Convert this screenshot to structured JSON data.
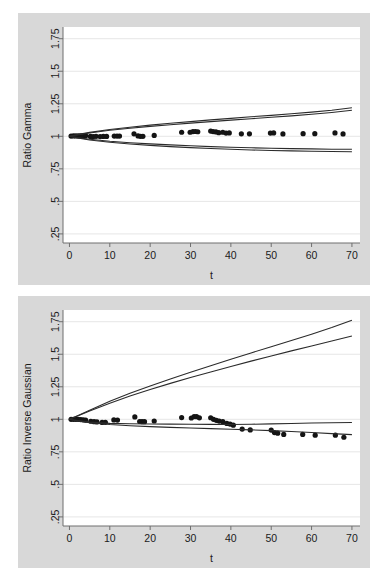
{
  "figure": {
    "background_color": "#ffffff",
    "panel_color": "#d8d8d8",
    "plot_color": "#ffffff",
    "grid_color": "#e6e6e6",
    "line_color": "#2b2b2b",
    "marker_color": "#141414"
  },
  "chart_data": [
    {
      "id": "gamma",
      "type": "scatter",
      "title": "",
      "xlabel": "t",
      "ylabel": "Ratio Gamma",
      "xlim": [
        -1.6,
        72
      ],
      "ylim": [
        0.18,
        1.84
      ],
      "xticks": [
        0,
        10,
        20,
        30,
        40,
        50,
        60,
        70
      ],
      "xticklabels": [
        "0",
        "10",
        "20",
        "30",
        "40",
        "50",
        "60",
        "70"
      ],
      "yticks": [
        0.25,
        0.5,
        0.75,
        1,
        1.25,
        1.5,
        1.75
      ],
      "yticklabels": [
        ".25",
        ".5",
        ".75",
        "1",
        "1.25",
        "1.5",
        "1.75"
      ],
      "grid": "horizontal",
      "legend": "none",
      "series": [
        {
          "name": "observed ratio",
          "kind": "points",
          "x": [
            0.4,
            1.0,
            1.6,
            2.2,
            2.8,
            3.4,
            4.0,
            5.2,
            5.9,
            6.6,
            7.6,
            8.4,
            9.2,
            11.1,
            11.8,
            12.4,
            16.0,
            17.0,
            17.6,
            18.2,
            21.0,
            27.8,
            29.9,
            30.6,
            31.2,
            31.8,
            35.0,
            35.6,
            36.3,
            37.0,
            38.0,
            38.8,
            39.6,
            42.6,
            44.6,
            49.8,
            50.6,
            52.9,
            57.9,
            60.8,
            65.8,
            67.8
          ],
          "y": [
            1.002,
            1.003,
            1.003,
            1.004,
            1.004,
            1.004,
            1.005,
            0.999,
            0.998,
            1.0,
            0.998,
            0.999,
            0.999,
            1.002,
            1.002,
            1.002,
            1.019,
            1.003,
            1.0,
            1.0,
            1.007,
            1.031,
            1.031,
            1.036,
            1.037,
            1.035,
            1.04,
            1.036,
            1.034,
            1.028,
            1.031,
            1.025,
            1.026,
            1.019,
            1.019,
            1.025,
            1.026,
            1.018,
            1.02,
            1.02,
            1.026,
            1.018
          ]
        },
        {
          "name": "upper band outer",
          "kind": "line",
          "x": [
            0,
            2,
            5,
            10,
            15,
            20,
            25,
            30,
            35,
            40,
            45,
            50,
            55,
            60,
            65,
            70
          ],
          "y": [
            1.0,
            1.013,
            1.03,
            1.052,
            1.07,
            1.086,
            1.1,
            1.113,
            1.126,
            1.138,
            1.15,
            1.161,
            1.173,
            1.186,
            1.2,
            1.219
          ]
        },
        {
          "name": "upper band inner",
          "kind": "line",
          "x": [
            0,
            2,
            5,
            10,
            15,
            20,
            25,
            30,
            35,
            40,
            45,
            50,
            55,
            60,
            65,
            70
          ],
          "y": [
            1.0,
            1.011,
            1.026,
            1.046,
            1.062,
            1.076,
            1.089,
            1.101,
            1.113,
            1.124,
            1.135,
            1.146,
            1.157,
            1.169,
            1.183,
            1.2
          ]
        },
        {
          "name": "lower band inner",
          "kind": "line",
          "x": [
            0,
            2,
            5,
            10,
            15,
            20,
            25,
            30,
            35,
            40,
            45,
            50,
            55,
            60,
            65,
            70
          ],
          "y": [
            1.0,
            0.99,
            0.977,
            0.962,
            0.951,
            0.942,
            0.934,
            0.927,
            0.921,
            0.916,
            0.912,
            0.908,
            0.905,
            0.903,
            0.901,
            0.9
          ]
        },
        {
          "name": "lower band outer",
          "kind": "line",
          "x": [
            0,
            2,
            5,
            10,
            15,
            20,
            25,
            30,
            35,
            40,
            45,
            50,
            55,
            60,
            65,
            70
          ],
          "y": [
            1.0,
            0.988,
            0.972,
            0.954,
            0.941,
            0.93,
            0.921,
            0.913,
            0.906,
            0.9,
            0.895,
            0.891,
            0.888,
            0.885,
            0.883,
            0.881
          ]
        }
      ]
    },
    {
      "id": "inverse-gaussian",
      "type": "scatter",
      "title": "",
      "xlabel": "t",
      "ylabel": "Ratio Inverse Gaussian",
      "xlim": [
        -1.6,
        72
      ],
      "ylim": [
        0.18,
        1.84
      ],
      "xticks": [
        0,
        10,
        20,
        30,
        40,
        50,
        60,
        70
      ],
      "xticklabels": [
        "0",
        "10",
        "20",
        "30",
        "40",
        "50",
        "60",
        "70"
      ],
      "yticks": [
        0.25,
        0.5,
        0.75,
        1,
        1.25,
        1.5,
        1.75
      ],
      "yticklabels": [
        ".25",
        ".5",
        ".75",
        "1",
        "1.25",
        "1.5",
        "1.75"
      ],
      "grid": "horizontal",
      "legend": "none",
      "series": [
        {
          "name": "observed ratio",
          "kind": "points",
          "x": [
            0.4,
            1.0,
            1.6,
            2.2,
            2.8,
            3.4,
            4.0,
            5.3,
            6.1,
            6.8,
            8.1,
            8.9,
            11.0,
            11.9,
            16.2,
            17.4,
            18.0,
            18.6,
            21.0,
            27.8,
            30.2,
            30.9,
            31.5,
            32.2,
            35.0,
            35.7,
            36.4,
            37.1,
            38.0,
            39.0,
            39.8,
            40.6,
            42.8,
            44.8,
            50.0,
            50.8,
            51.6,
            53.1,
            57.8,
            60.9,
            65.9,
            68.0
          ],
          "y": [
            1.0,
            1.0,
            1.0,
            1.0,
            0.998,
            0.996,
            0.994,
            0.985,
            0.982,
            0.98,
            0.976,
            0.977,
            0.995,
            0.994,
            1.018,
            0.983,
            0.982,
            0.982,
            0.987,
            1.013,
            1.01,
            1.021,
            1.02,
            1.011,
            1.012,
            1.0,
            0.992,
            0.986,
            0.982,
            0.968,
            0.963,
            0.955,
            0.925,
            0.918,
            0.917,
            0.898,
            0.893,
            0.884,
            0.884,
            0.878,
            0.878,
            0.862
          ]
        },
        {
          "name": "upper band outer",
          "kind": "line",
          "x": [
            0,
            2,
            5,
            10,
            15,
            20,
            25,
            30,
            35,
            40,
            45,
            50,
            55,
            60,
            65,
            70
          ],
          "y": [
            1.0,
            1.028,
            1.07,
            1.139,
            1.2,
            1.256,
            1.31,
            1.362,
            1.412,
            1.461,
            1.51,
            1.558,
            1.606,
            1.654,
            1.705,
            1.762
          ]
        },
        {
          "name": "upper band inner",
          "kind": "line",
          "x": [
            0,
            2,
            5,
            10,
            15,
            20,
            25,
            30,
            35,
            40,
            45,
            50,
            55,
            60,
            65,
            70
          ],
          "y": [
            1.0,
            1.026,
            1.063,
            1.124,
            1.179,
            1.229,
            1.276,
            1.321,
            1.364,
            1.406,
            1.447,
            1.487,
            1.526,
            1.564,
            1.602,
            1.64
          ]
        },
        {
          "name": "lower band inner",
          "kind": "line",
          "x": [
            0,
            2,
            5,
            10,
            15,
            20,
            25,
            30,
            35,
            40,
            45,
            50,
            55,
            60,
            65,
            70
          ],
          "y": [
            1.0,
            0.99,
            0.978,
            0.969,
            0.966,
            0.964,
            0.963,
            0.962,
            0.961,
            0.96,
            0.962,
            0.965,
            0.968,
            0.971,
            0.973,
            0.975
          ]
        },
        {
          "name": "lower band outer",
          "kind": "line",
          "x": [
            0,
            2,
            5,
            10,
            15,
            20,
            25,
            30,
            35,
            40,
            45,
            50,
            55,
            60,
            65,
            70
          ],
          "y": [
            1.0,
            0.988,
            0.974,
            0.96,
            0.951,
            0.944,
            0.938,
            0.933,
            0.928,
            0.924,
            0.919,
            0.913,
            0.906,
            0.898,
            0.89,
            0.882
          ]
        }
      ]
    }
  ]
}
